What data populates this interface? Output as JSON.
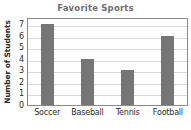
{
  "chart_data": {
    "type": "bar",
    "title": "Favorite Sports",
    "xlabel": "",
    "ylabel": "Number of Students",
    "categories": [
      "Soccer",
      "Baseball",
      "Tennis",
      "Football"
    ],
    "values": [
      7,
      4,
      3,
      6
    ],
    "ylim": [
      0,
      7.6
    ],
    "yticks": [
      0,
      1,
      2,
      3,
      4,
      5,
      6,
      7
    ],
    "ytick_labels": [
      "0",
      "1",
      "2",
      "3",
      "4",
      "5",
      "6",
      "7"
    ],
    "grid": true,
    "grid_axis": "y",
    "legend": false,
    "legend_position": "none",
    "colors": {
      "bar": "#767676",
      "title_text": "#6e6e6e",
      "axis_text": "#2b2b2b",
      "gridline": "#d9d9d9",
      "plot_border": "#8a8a8a",
      "background": "#ffffff"
    }
  }
}
